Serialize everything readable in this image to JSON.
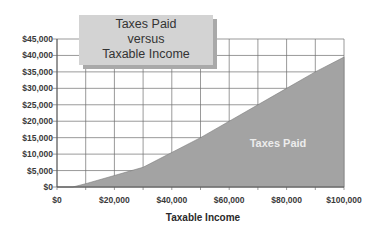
{
  "chart_data": {
    "type": "area",
    "title": "Taxes Paid versus Taxable Income",
    "title_lines": [
      "Taxes Paid",
      "versus",
      "Taxable Income"
    ],
    "xlabel": "Taxable Income",
    "ylabel": "",
    "xlim": [
      0,
      100000
    ],
    "ylim": [
      0,
      45000
    ],
    "grid": true,
    "legend_position": "none",
    "x_tick_labels": [
      "$0",
      "$20,000",
      "$40,000",
      "$60,000",
      "$80,000",
      "$100,000"
    ],
    "y_tick_labels": [
      "$45,000",
      "$40,000",
      "$35,000",
      "$30,000",
      "$25,000",
      "$20,000",
      "$15,000",
      "$10,000",
      "$5,000",
      "$0"
    ],
    "series": [
      {
        "name": "Taxes Paid",
        "color": "#a3a3a3",
        "x": [
          0,
          5500,
          10000,
          20000,
          30000,
          40000,
          50000,
          60000,
          70000,
          80000,
          90000,
          100000
        ],
        "values": [
          0,
          0,
          1000,
          3500,
          6000,
          10500,
          15000,
          20000,
          25000,
          30000,
          35000,
          39500
        ]
      }
    ],
    "annotations": [
      {
        "text": "Taxes Paid",
        "x": 77000,
        "y": 13500
      }
    ]
  },
  "colors": {
    "fill": "#a3a3a3",
    "fill_stroke": "#7a7a7a",
    "grid": "#6e6e6e",
    "title_box": "#d3d3d3",
    "title_shadow": "#a9a9a9"
  }
}
